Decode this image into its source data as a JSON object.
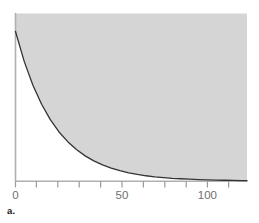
{
  "figure": {
    "panel_label": "a.",
    "background_color": "#ffffff"
  },
  "chart_data": {
    "type": "area",
    "title": "",
    "subtitle": "",
    "xlabel": "",
    "ylabel": "",
    "legend": [],
    "grid": false,
    "legend_position": "none",
    "curve": {
      "kind": "exponential-decay",
      "y0": 1.0,
      "decay_rate": 0.0446,
      "half_life": 15.5,
      "color": "#333333",
      "line_width": 1.3
    },
    "fill": {
      "region": "above-curve",
      "color": "#d5d5d5"
    },
    "xlim": [
      0,
      133
    ],
    "ylim": [
      0,
      1.12
    ],
    "x_major_ticks": [
      0,
      50,
      100
    ],
    "x_major_tick_labels": [
      "0",
      "50",
      "100"
    ],
    "x_minor_ticks": [
      10,
      20,
      30,
      40,
      60,
      70,
      80,
      90,
      110,
      120,
      130
    ],
    "y_ticks": [],
    "y_tick_labels": [],
    "x": [
      0,
      5,
      10,
      15,
      20,
      25,
      30,
      35,
      40,
      45,
      50,
      55,
      60,
      65,
      70,
      75,
      80,
      85,
      90,
      95,
      100,
      105,
      110,
      115,
      120,
      125,
      130,
      133
    ],
    "y": [
      1.0,
      0.8,
      0.64,
      0.513,
      0.41,
      0.328,
      0.263,
      0.21,
      0.168,
      0.135,
      0.108,
      0.086,
      0.069,
      0.055,
      0.044,
      0.035,
      0.028,
      0.023,
      0.018,
      0.015,
      0.012,
      0.009,
      0.007,
      0.006,
      0.005,
      0.004,
      0.003,
      0.003
    ],
    "axis_color": "#b0b0b0",
    "tick_color": "#9a9a9a",
    "tick_label_color": "#6f6f6f"
  }
}
